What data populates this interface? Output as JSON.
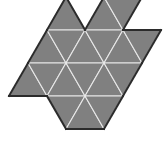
{
  "figure": {
    "background_color": "#ffffff",
    "face_fill_color": "#808080",
    "interior_edge_color": "#e8e8e8",
    "outline_color": "#2b2b2b",
    "triangle_count": 24,
    "triangle_side_px": 38,
    "triangle_height_px": 33,
    "canvas": {
      "width": 166,
      "height": 144
    }
  },
  "geometry": {
    "rows_y": [
      -3,
      30,
      63,
      96,
      129
    ],
    "col_step_x": 19,
    "origin_x": 9,
    "faces": [
      {
        "id": "t01",
        "points": "47,30 66,-3 85,30"
      },
      {
        "id": "t02",
        "points": "85,30 104,-3 123,30"
      },
      {
        "id": "t03",
        "points": "104,-3 123,30 142,-3"
      },
      {
        "id": "t04",
        "points": "28,63 47,30 66,63"
      },
      {
        "id": "t05",
        "points": "47,30 66,63 85,30"
      },
      {
        "id": "t06",
        "points": "66,63 85,30 104,63"
      },
      {
        "id": "t07",
        "points": "85,30 104,63 123,30"
      },
      {
        "id": "t08",
        "points": "104,63 123,30 142,63"
      },
      {
        "id": "t09",
        "points": "123,30 142,63 161,30"
      },
      {
        "id": "t10",
        "points": "9,96 28,63 47,96"
      },
      {
        "id": "t11",
        "points": "28,63 47,96 66,63"
      },
      {
        "id": "t12",
        "points": "47,96 66,63 85,96"
      },
      {
        "id": "t13",
        "points": "66,63 85,96 104,63"
      },
      {
        "id": "t14",
        "points": "85,96 104,63 123,96"
      },
      {
        "id": "t15",
        "points": "104,63 123,96 142,63"
      },
      {
        "id": "t16",
        "points": "47,96 66,129 85,96"
      },
      {
        "id": "t17",
        "points": "66,129 85,96 104,129"
      },
      {
        "id": "t18",
        "points": "85,96 104,129 123,96"
      }
    ],
    "outline_path": "M 66,-3 L 85,30 L 104,-3 L 142,-3 L 123,30 L 161,30 L 142,63 L 123,30 L 104,63 L 123,96 L 142,63 L 123,96 L 104,129 L 85,96 L 66,129 L 47,96 L 9,96 L 28,63 L 47,30 L 28,63 L 47,96 L 28,63 L 9,96 L 47,96 L 47,30 Z"
  }
}
